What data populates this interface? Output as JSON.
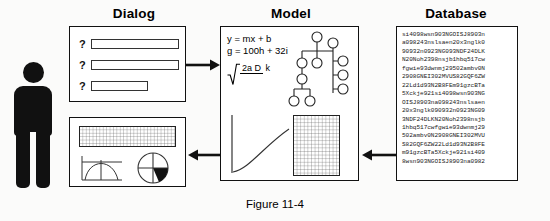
{
  "figure": {
    "caption": "Figure 11-4",
    "ink_color": "#111111",
    "paper_color": "#fbfbfa"
  },
  "headers": {
    "dialog": "Dialog",
    "model": "Model",
    "database": "Database"
  },
  "actor": {
    "name": "person-pictogram"
  },
  "dialog_panel": {
    "rows": [
      {
        "label": "?",
        "value": "",
        "placeholder": ""
      },
      {
        "label": "?",
        "value": "",
        "placeholder": ""
      },
      {
        "label": "?",
        "value": "",
        "placeholder": ""
      }
    ]
  },
  "model_panel": {
    "equations": [
      "y = mx + b",
      "g = 100h + 32i"
    ],
    "radical": {
      "numerator": "2a D",
      "denominator": "k"
    },
    "tree_label": "node-tree-diagram",
    "curve_label": "growth-curve-plot",
    "grid_label": "data-grid"
  },
  "database_panel": {
    "lines": [
      "si4098wsn903NGOISJ8903n",
      "a098243nslsaen20x3nglk0",
      "90932n0923NG093NDF24DLK",
      "N20Noh2398nsjb1hbq517cw",
      "fgwie93dwnmj29502ambv0N",
      "2908GNEI302MVUS82GQF6ZW",
      "22Ld1d93N2B8FEm91gzcBTa",
      "5Xckje921si4098wsn903NG",
      "OISJ8903na098243nslsaen",
      "20x3nglk090932n0923NG09",
      "3NDF24DLKN20Noh2398nsjb",
      "1hbq517cwfgwie93dwnmj29",
      "502ambv0N2908GNEI302MVU",
      "S82GQF6ZW22Ld1d93N2B8FE",
      "m91gzcBTa5Xckje921si409",
      "8wsn903NGOISJ8903na0982"
    ]
  },
  "report_panel": {
    "grid_label": "results-table-grid",
    "curve_label": "arc-chart",
    "pie_label": "pie-chart"
  },
  "arrows": [
    {
      "name": "arrow-dialog-to-model",
      "direction": "right"
    },
    {
      "name": "arrow-database-to-model",
      "direction": "left"
    },
    {
      "name": "arrow-model-to-report",
      "direction": "left"
    }
  ]
}
